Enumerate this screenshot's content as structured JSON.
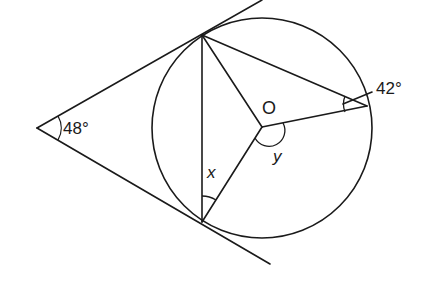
{
  "figure": {
    "type": "geometry-diagram",
    "circle": {
      "center_label": "O",
      "cx": 262,
      "cy": 128,
      "r": 110
    },
    "external_point": {
      "x": 37,
      "y": 128
    },
    "tangent_points": {
      "top": {
        "x": 202,
        "y": 35
      },
      "bottom": {
        "x": 202,
        "y": 222
      }
    },
    "circle_point_right": {
      "x": 367,
      "y": 106
    },
    "labels": {
      "external_angle": "48°",
      "centre": "O",
      "inscribed_angle": "42°",
      "angle_x": "x",
      "angle_y": "y"
    },
    "colors": {
      "stroke": "#1a1a1a",
      "background": "#ffffff"
    }
  }
}
